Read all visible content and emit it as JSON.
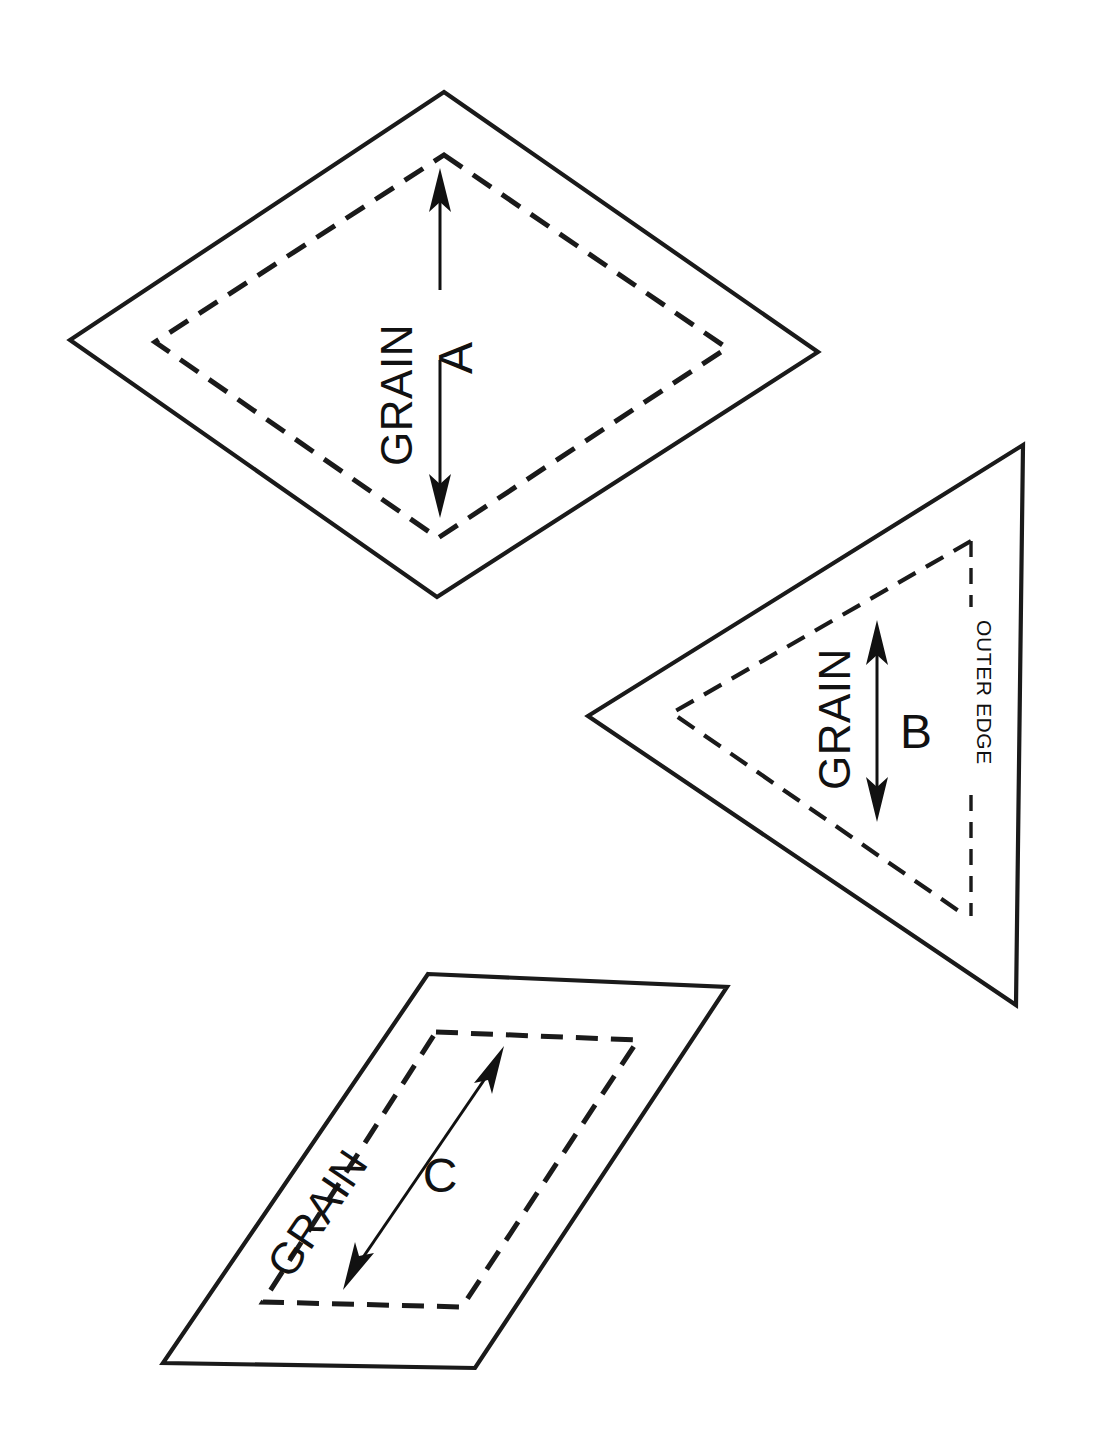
{
  "sheet": {
    "title": "Quilt Pattern Template Pieces",
    "background_color": "#ffffff",
    "line_color": "#1a1a1a",
    "width": 1095,
    "height": 1445
  },
  "legend": {
    "cut_line_description": "solid outer cutting line",
    "seam_line_description": "dashed inner seam line",
    "grain_arrow_description": "double-headed grain direction arrow"
  },
  "pieces": [
    {
      "id": "A",
      "label": "A",
      "shape": "diamond",
      "grain_label": "GRAIN",
      "grain_label_rotation": -90,
      "piece_label_rotation": -90,
      "arrow_style": "split-by-label",
      "outer_points": "444,92 818,352 437,597 70,340",
      "inner_points": "444,155 727,348 438,538 155,342",
      "arrow_top": {
        "x": 440,
        "y": 178,
        "x2": 440,
        "y2": 290
      },
      "arrow_bottom": {
        "x": 440,
        "y": 360,
        "x2": 440,
        "y2": 512
      },
      "grain_text_pos": {
        "x": 412,
        "y": 395
      },
      "label_text_pos": {
        "x": 470,
        "y": 360
      }
    },
    {
      "id": "B",
      "label": "B",
      "shape": "triangle",
      "grain_label": "GRAIN",
      "grain_label_rotation": -90,
      "piece_label_rotation": 0,
      "arrow_style": "continuous",
      "outer_points": "1023,445 1016,1005 588,716",
      "inner_points": "971,541 966,916 672,713",
      "outer_edge_label": "OUTER EDGE",
      "outer_edge_label_rotation": 90,
      "arrow": {
        "x": 877,
        "y": 625,
        "x2": 877,
        "y2": 817
      },
      "grain_text_pos": {
        "x": 852,
        "y": 790
      },
      "label_text_pos": {
        "x": 898,
        "y": 745
      },
      "edge_line": {
        "x": 971,
        "y1": 541,
        "y2": 916
      },
      "edge_text_pos": {
        "x": 971,
        "y": 665
      }
    },
    {
      "id": "C",
      "label": "C",
      "shape": "parallelogram",
      "grain_label": "GRAIN",
      "grain_label_rotation": -56,
      "piece_label_rotation": 0,
      "arrow_style": "continuous-diagonal",
      "outer_points": "428,974 727,987 475,1368 163,1363",
      "inner_points": "436,1032 638,1040 462,1307 263,1302",
      "arrow": {
        "x": 348,
        "y": 1282,
        "x2": 500,
        "y2": 1053
      },
      "grain_text_pos": {
        "x": 330,
        "y": 1220
      },
      "label_text_pos": {
        "x": 437,
        "y": 1185
      }
    }
  ]
}
